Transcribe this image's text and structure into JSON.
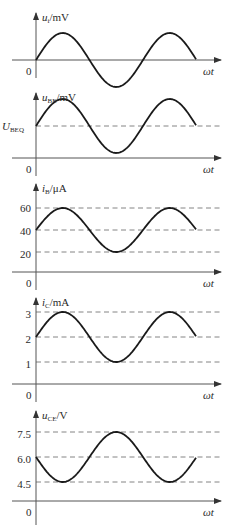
{
  "figure": {
    "x_axis_label": "ωt",
    "origin_label": "0",
    "panels": [
      {
        "id": "ui",
        "y_label_main": "u",
        "y_label_sub": "i",
        "y_label_unit": "/mV",
        "axis_y": 60,
        "y_top": 13,
        "y_bottom": 78,
        "baseline": 60,
        "amplitude": 27,
        "invert": false,
        "ref_lines": [],
        "ticks": []
      },
      {
        "id": "uBE",
        "y_label_main": "u",
        "y_label_sub": "BE",
        "y_label_unit": "/mV",
        "axis_y": 158,
        "y_top": 93,
        "y_bottom": 176,
        "baseline": 126,
        "amplitude": 27,
        "invert": false,
        "ref_lines": [
          126
        ],
        "baseline_label_main": "U",
        "baseline_label_sub": "BEQ",
        "ticks": []
      },
      {
        "id": "iB",
        "y_label_main": "i",
        "y_label_sub": "B",
        "y_label_unit": "/μA",
        "axis_y": 272,
        "y_top": 184,
        "y_bottom": 290,
        "baseline": 230,
        "amplitude": 22,
        "invert": false,
        "ref_lines": [
          208,
          230,
          252
        ],
        "ticks": [
          {
            "label": "60",
            "y": 208
          },
          {
            "label": "40",
            "y": 231
          },
          {
            "label": "20",
            "y": 254
          }
        ]
      },
      {
        "id": "iC",
        "y_label_main": "i",
        "y_label_sub": "C",
        "y_label_unit": "/mA",
        "axis_y": 384,
        "y_top": 298,
        "y_bottom": 402,
        "baseline": 337,
        "amplitude": 25,
        "invert": false,
        "ref_lines": [
          312,
          337,
          362
        ],
        "ticks": [
          {
            "label": "3",
            "y": 314
          },
          {
            "label": "2",
            "y": 339
          },
          {
            "label": "1",
            "y": 364
          }
        ]
      },
      {
        "id": "uCE",
        "y_label_main": "u",
        "y_label_sub": "CE",
        "y_label_unit": "/V",
        "axis_y": 501,
        "y_top": 411,
        "y_bottom": 525,
        "baseline": 457,
        "amplitude": 25,
        "invert": true,
        "ref_lines": [
          432,
          457,
          482
        ],
        "ticks": [
          {
            "label": "7.5",
            "y": 434
          },
          {
            "label": "6.0",
            "y": 459
          },
          {
            "label": "4.5",
            "y": 484
          }
        ]
      }
    ]
  },
  "chart_data": [
    {
      "type": "line",
      "title": "u_i/mV",
      "xlabel": "ωt",
      "ylabel": "u_i/mV",
      "series": [
        {
          "name": "u_i",
          "shape": "sine",
          "offset": 0,
          "cycles": 1.5,
          "phase": "starts at 0 rising"
        }
      ]
    },
    {
      "type": "line",
      "title": "u_BE/mV",
      "xlabel": "ωt",
      "ylabel": "u_BE/mV",
      "annotations": [
        "U_BEQ"
      ],
      "series": [
        {
          "name": "u_BE",
          "shape": "sine",
          "offset": "U_BEQ",
          "cycles": 1.5
        }
      ]
    },
    {
      "type": "line",
      "title": "i_B/μA",
      "xlabel": "ωt",
      "ylabel": "i_B/μA",
      "yticks": [
        20,
        40,
        60
      ],
      "series": [
        {
          "name": "i_B",
          "shape": "sine",
          "offset": 40,
          "min": 20,
          "max": 60,
          "cycles": 1.5
        }
      ]
    },
    {
      "type": "line",
      "title": "i_C/mA",
      "xlabel": "ωt",
      "ylabel": "i_C/mA",
      "yticks": [
        1,
        2,
        3
      ],
      "series": [
        {
          "name": "i_C",
          "shape": "sine",
          "offset": 2,
          "min": 1,
          "max": 3,
          "cycles": 1.5
        }
      ]
    },
    {
      "type": "line",
      "title": "u_CE/V",
      "xlabel": "ωt",
      "ylabel": "u_CE/V",
      "yticks": [
        4.5,
        6.0,
        7.5
      ],
      "series": [
        {
          "name": "u_CE",
          "shape": "inverted sine",
          "offset": 6.0,
          "min": 4.5,
          "max": 7.5,
          "cycles": 1.5
        }
      ]
    }
  ]
}
